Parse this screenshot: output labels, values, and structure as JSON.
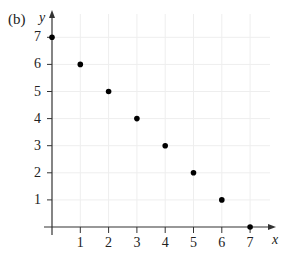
{
  "panel_label": "(b)",
  "chart_data": {
    "type": "scatter",
    "title": "",
    "xlabel": "x",
    "ylabel": "y",
    "x": [
      0,
      1,
      2,
      3,
      4,
      5,
      6,
      7
    ],
    "y": [
      7,
      6,
      5,
      4,
      3,
      2,
      1,
      0
    ],
    "xlim": [
      0,
      7.8
    ],
    "ylim": [
      0,
      8
    ],
    "x_ticks": [
      "1",
      "2",
      "3",
      "4",
      "5",
      "6",
      "7"
    ],
    "y_ticks": [
      "1",
      "2",
      "3",
      "4",
      "5",
      "6",
      "7"
    ],
    "grid": true,
    "legend": null,
    "marker_color": "#000000"
  }
}
